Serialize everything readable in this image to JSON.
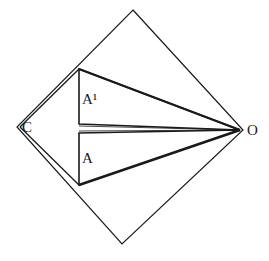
{
  "diagram": {
    "labels": {
      "C": "C",
      "O": "O",
      "A": "A",
      "A_prime": "A¹"
    },
    "colors": {
      "stroke": "#1a1a1a",
      "background": "#ffffff"
    },
    "points": {
      "outer_top": [
        133,
        10
      ],
      "outer_right": [
        243,
        130
      ],
      "outer_bottom": [
        122,
        244
      ],
      "outer_left": [
        17,
        127
      ],
      "A_prime_top": [
        79,
        69
      ],
      "A_prime_bottom": [
        79,
        124
      ],
      "A_top": [
        79,
        133
      ],
      "A_bottom": [
        79,
        185
      ]
    }
  }
}
